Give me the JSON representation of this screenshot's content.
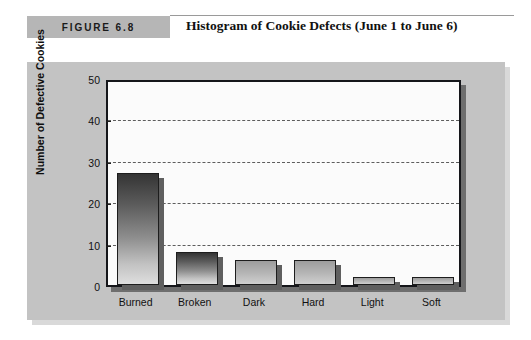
{
  "figure": {
    "label": "FIGURE 6.8",
    "title": "Histogram of Cookie Defects (June 1 to June 6)"
  },
  "colors": {
    "panel_background": "#c3c3c3",
    "label_background": "#b6b6b6",
    "plot_background": "#fbfbfb",
    "axis": "#15161a",
    "gridline": "#5d5d5d",
    "bar_top": "#343434",
    "bar_bottom": "#dedede",
    "shadow": "#5f5f5f"
  },
  "chart_data": {
    "type": "bar",
    "title": "Histogram of Cookie Defects (June 1 to June 6)",
    "categories": [
      "Burned",
      "Broken",
      "Dark",
      "Hard",
      "Light",
      "Soft"
    ],
    "values": [
      27,
      8,
      6,
      6,
      2,
      2
    ],
    "xlabel": "",
    "ylabel": "Number of Defective Cookies",
    "ylim": [
      0,
      50
    ],
    "yticks": [
      0,
      10,
      20,
      30,
      40,
      50
    ],
    "ytick_labels": [
      "0",
      "10",
      "20",
      "30",
      "40",
      "50"
    ],
    "grid": true,
    "grid_axis": "y",
    "grid_style": "dashed",
    "legend": false
  }
}
